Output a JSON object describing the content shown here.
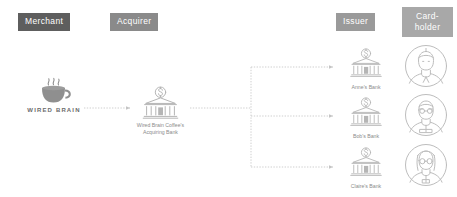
{
  "diagram": {
    "colors": {
      "badge_merchant_bg": "#5e5e5e",
      "badge_acquirer_bg": "#8a8a8a",
      "badge_issuer_bg": "#9a9a9a",
      "badge_cardholder_bg": "#a8a8a8",
      "badge_text": "#ffffff",
      "line": "#cfcfcf",
      "icon_stroke": "#b8b8b8",
      "label_text": "#8b8b8b",
      "background": "#ffffff"
    },
    "columns": [
      {
        "key": "merchant",
        "label": "Merchant"
      },
      {
        "key": "acquirer",
        "label": "Acquirer"
      },
      {
        "key": "issuer",
        "label": "Issuer"
      },
      {
        "key": "cardholder",
        "label": "Card-\nholder"
      }
    ],
    "merchant": {
      "icon": "coffee-cup-icon",
      "wordmark": "WIRED BRAIN"
    },
    "acquirer": {
      "icon": "bank-dollar-icon",
      "label": "Wired Brain Coffee's\nAcquiring Bank"
    },
    "issuers": [
      {
        "icon": "bank-dollar-icon",
        "label": "Anne's Bank"
      },
      {
        "icon": "bank-dollar-icon",
        "label": "Bob's Bank"
      },
      {
        "icon": "bank-dollar-icon",
        "label": "Claire's Bank"
      }
    ],
    "cardholders": [
      {
        "icon": "avatar-person-icon",
        "alt": "Anne"
      },
      {
        "icon": "avatar-person-icon",
        "alt": "Bob"
      },
      {
        "icon": "avatar-person-icon",
        "alt": "Claire"
      }
    ],
    "connectors": [
      {
        "from": "merchant",
        "to": "acquirer",
        "style": "dotted",
        "arrow": true
      },
      {
        "from": "acquirer",
        "to": "anne-bank",
        "style": "dotted",
        "arrow": true
      },
      {
        "from": "acquirer",
        "to": "bob-bank",
        "style": "dotted",
        "arrow": true
      },
      {
        "from": "acquirer",
        "to": "claire-bank",
        "style": "dotted",
        "arrow": true
      }
    ]
  }
}
